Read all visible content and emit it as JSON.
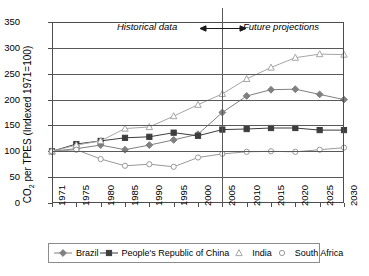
{
  "chart_data": {
    "type": "line",
    "title": "",
    "xlabel": "",
    "ylabel": "CO2 per TPES (Indexed 1971=100)",
    "ylim": [
      0,
      350
    ],
    "ytick_values": [
      0,
      50,
      100,
      150,
      200,
      250,
      300,
      350
    ],
    "grid": true,
    "legend_position": "bottom",
    "categories": [
      "1971",
      "1975",
      "1980",
      "1985",
      "1990",
      "1995",
      "2000",
      "2005",
      "2010",
      "2015",
      "2020",
      "2025",
      "2030"
    ],
    "annotations": [
      {
        "text": "Historical data",
        "at": "2005",
        "side": "left"
      },
      {
        "text": "Future projections",
        "at": "2005",
        "side": "right"
      }
    ],
    "divider_at": "2005",
    "series": [
      {
        "name": "Brazil",
        "marker": "diamond",
        "values": [
          100,
          105,
          112,
          103,
          112,
          122,
          133,
          175,
          207,
          219,
          220,
          210,
          200
        ]
      },
      {
        "name": "People's Republic of China",
        "marker": "square",
        "values": [
          100,
          114,
          120,
          126,
          128,
          136,
          130,
          142,
          143,
          145,
          145,
          141,
          141
        ]
      },
      {
        "name": "India",
        "marker": "triangle",
        "values": [
          100,
          112,
          120,
          144,
          147,
          168,
          190,
          211,
          240,
          262,
          281,
          288,
          287
        ]
      },
      {
        "name": "South Africa",
        "marker": "circle",
        "values": [
          100,
          103,
          85,
          72,
          75,
          70,
          88,
          95,
          99,
          100,
          99,
          103,
          107
        ]
      }
    ]
  },
  "ytick_labels": [
    "350",
    "300",
    "250",
    "200",
    "150",
    "100",
    "50",
    "0"
  ],
  "xtick_labels": [
    "1971",
    "1975",
    "1980",
    "1985",
    "1990",
    "1995",
    "2000",
    "2005",
    "2010",
    "2015",
    "2020",
    "2025",
    "2030"
  ],
  "annotation_historical": "Historical data",
  "annotation_future": "Future projections",
  "legend": [
    {
      "label": "Brazil",
      "marker": "diamond-marker"
    },
    {
      "label": "People's Republic of China",
      "marker": "square-marker"
    },
    {
      "label": "India",
      "marker": "triangle-marker"
    },
    {
      "label": "South Africa",
      "marker": "circle-marker"
    }
  ],
  "colors": {
    "axis": "#4d4d4d",
    "grid": "#595959",
    "brazil": "#808080",
    "china": "#3d3d3d",
    "india": "#a6a6a6",
    "south_africa": "#999999",
    "background": "#ffffff"
  }
}
